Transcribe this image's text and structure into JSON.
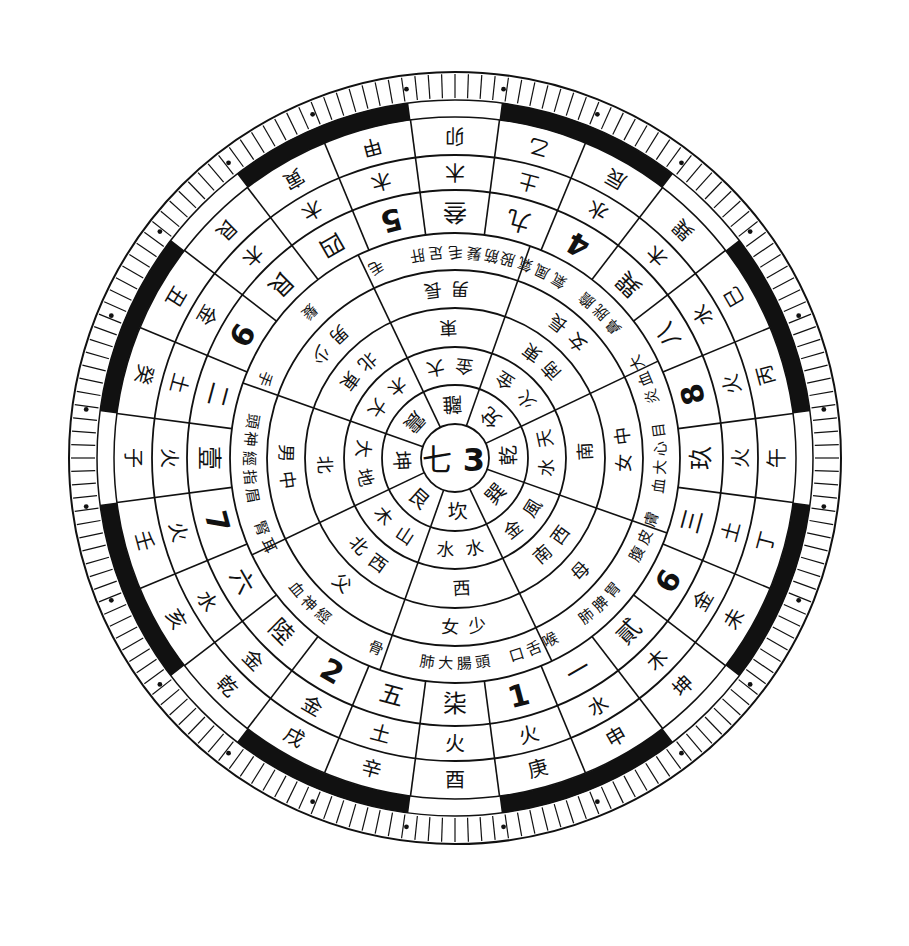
{
  "diagram": {
    "center": {
      "label_left": "七",
      "label_right": "3"
    },
    "colors": {
      "ink": "#111111",
      "paper": "#ffffff"
    },
    "mountains_ring": {
      "labels": [
        "卯",
        "乙",
        "辰",
        "巽",
        "巳",
        "丙",
        "午",
        "丁",
        "未",
        "坤",
        "申",
        "庚",
        "酉",
        "辛",
        "戌",
        "乾",
        "亥",
        "壬",
        "子",
        "癸",
        "丑",
        "艮",
        "寅",
        "甲"
      ]
    },
    "elements_ring": {
      "labels": [
        "木",
        "土",
        "水",
        "木",
        "水",
        "火",
        "火",
        "土",
        "金",
        "木",
        "水",
        "火",
        "火",
        "土",
        "金",
        "金",
        "水",
        "火",
        "火",
        "土",
        "金",
        "木",
        "木",
        "木"
      ]
    },
    "numerals_ring": {
      "labels": [
        "叁",
        "九",
        "4",
        "巽",
        "八",
        "8",
        "玖",
        "三",
        "6",
        "貳",
        "一",
        "1",
        "柒",
        "五",
        "2",
        "陸",
        "六",
        "7",
        "壹",
        "二",
        "9",
        "艮",
        "四",
        "5"
      ]
    },
    "body_ring": {
      "labels": [
        "肝足毛髮筋",
        "股氣風氣",
        "膽胱鼻",
        "大血炎",
        "目心大血",
        "膚皮腹",
        "胃脾肺",
        "喉舌口",
        "頭腸大肺",
        "骨",
        "經神血",
        "耳腎",
        "眉指經神頭",
        "手",
        "髮",
        "毛"
      ]
    },
    "family_ring": {
      "labels": [
        "長男",
        "長女",
        "中女",
        "母",
        "少女",
        "父",
        "中男",
        "少男"
      ]
    },
    "direction_ring": {
      "labels": [
        "東",
        "東南",
        "南",
        "西南",
        "西",
        "西北",
        "北",
        "東北"
      ]
    },
    "number_element_ring": {
      "labels": [
        "三木",
        "四木",
        "九火",
        "二土",
        "七金",
        "六金",
        "一水",
        "八土"
      ]
    },
    "element_ring_inner": {
      "labels": [
        "大金",
        "金火",
        "天水",
        "風金",
        "水水",
        "山木",
        "地大",
        "大木"
      ]
    },
    "trigram_ring": {
      "labels": [
        "離",
        "兌",
        "乾",
        "巽",
        "坎",
        "艮",
        "坤",
        "震"
      ]
    }
  }
}
